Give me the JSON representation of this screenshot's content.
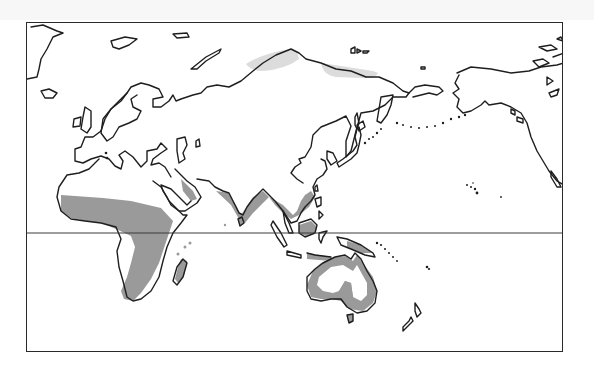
{
  "map": {
    "type": "world-distribution-map",
    "projection_hint": "Eastern-hemisphere centered, Europe/Africa to Alaska",
    "frame": {
      "left": 26,
      "top": 22,
      "right": 563,
      "bottom": 352
    },
    "equator": {
      "visible": true,
      "y": 232
    },
    "legend": null,
    "title": null,
    "colors": {
      "primary_range": "#9a9a9a",
      "secondary_range": "#dcdcdc",
      "coastline": "#1e1e1e",
      "background": "#ffffff",
      "frame": "#2a2a2a"
    },
    "shaded_regions": [
      {
        "name": "Sub-Saharan Africa",
        "shade": "primary_range"
      },
      {
        "name": "Madagascar",
        "shade": "primary_range"
      },
      {
        "name": "Arabian Peninsula coast",
        "shade": "primary_range"
      },
      {
        "name": "Indian subcontinent coast",
        "shade": "primary_range"
      },
      {
        "name": "Southeast Asia coast",
        "shade": "primary_range"
      },
      {
        "name": "Indonesia / Borneo / New Guinea",
        "shade": "primary_range"
      },
      {
        "name": "Australia (coastal ring and central patch)",
        "shade": "primary_range"
      },
      {
        "name": "Northern Siberia (west)",
        "shade": "secondary_range"
      },
      {
        "name": "Northern Siberia (east)",
        "shade": "secondary_range"
      }
    ]
  }
}
